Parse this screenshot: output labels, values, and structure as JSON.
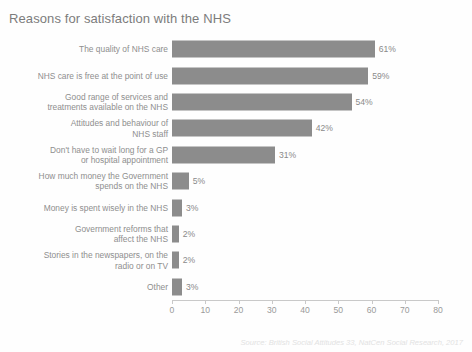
{
  "chart_data": {
    "type": "bar",
    "orientation": "horizontal",
    "title": "Reasons for satisfaction with the NHS",
    "xlabel": "",
    "ylabel": "",
    "xlim": [
      0,
      80
    ],
    "xticks": [
      0,
      10,
      20,
      30,
      40,
      50,
      60,
      70,
      80
    ],
    "grid": false,
    "legend": null,
    "bar_color": "#8c8c8c",
    "categories": [
      "The quality of NHS care",
      "NHS care is free at the point of use",
      "Good range of services and\ntreatments available on the NHS",
      "Attitudes and behaviour of\nNHS staff",
      "Don't have to wait long for a GP\nor hospital appointment",
      "How much money the Government\nspends on the NHS",
      "Money is spent wisely in the NHS",
      "Government reforms that\naffect the NHS",
      "Stories in the newspapers, on the\nradio or on TV",
      "Other"
    ],
    "values": [
      61,
      59,
      54,
      42,
      31,
      5,
      3,
      2,
      2,
      3
    ],
    "value_labels": [
      "61%",
      "59%",
      "54%",
      "42%",
      "31%",
      "5%",
      "3%",
      "2%",
      "2%",
      "3%"
    ],
    "tick_labels": [
      "0",
      "10",
      "20",
      "30",
      "40",
      "50",
      "60",
      "70",
      "80"
    ],
    "source": "Source: British Social Attitudes 33, NatCen Social Research, 2017"
  }
}
